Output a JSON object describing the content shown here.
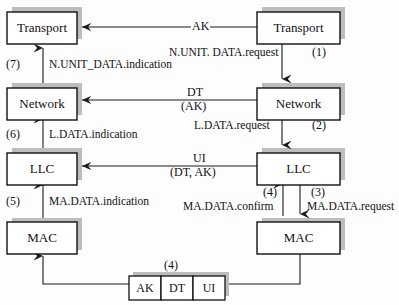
{
  "diagram": {
    "colors": {
      "line": "#1a1a1a",
      "box_fill": "#ffffff",
      "box_border": "#111111",
      "shadow": "#b9b9b9",
      "page": "#fdfdfd"
    },
    "left_stack": {
      "boxes": [
        {
          "label": "Transport",
          "name": "left-transport-box"
        },
        {
          "label": "Network",
          "name": "left-network-box"
        },
        {
          "label": "LLC",
          "name": "left-llc-box"
        },
        {
          "label": "MAC",
          "name": "left-mac-box"
        }
      ],
      "primitives": [
        {
          "step": "(7)",
          "label": "N.UNIT_DATA.indication"
        },
        {
          "step": "(6)",
          "label": "L.DATA.indication"
        },
        {
          "step": "(5)",
          "label": "MA.DATA.indication"
        }
      ]
    },
    "right_stack": {
      "boxes": [
        {
          "label": "Transport",
          "name": "right-transport-box"
        },
        {
          "label": "Network",
          "name": "right-network-box"
        },
        {
          "label": "LLC",
          "name": "right-llc-box"
        },
        {
          "label": "MAC",
          "name": "right-mac-box"
        }
      ],
      "primitives": [
        {
          "step": "(1)",
          "label": "N.UNIT. DATA.request"
        },
        {
          "step": "(2)",
          "label": "L.DATA.request"
        },
        {
          "step": "(3)",
          "label": "MA.DATA.request"
        },
        {
          "step": "(4)",
          "label": "MA.DATA.confirm"
        }
      ]
    },
    "peer_links": [
      {
        "name": "transport-peer-link",
        "line1": "AK",
        "line2": ""
      },
      {
        "name": "network-peer-link",
        "line1": "DT",
        "line2": "(AK)"
      },
      {
        "name": "llc-peer-link",
        "line1": "UI",
        "line2": "(DT, AK)"
      }
    ],
    "frame": {
      "step": "(4)",
      "fields": [
        {
          "label": "AK"
        },
        {
          "label": "DT"
        },
        {
          "label": "UI"
        }
      ]
    }
  }
}
